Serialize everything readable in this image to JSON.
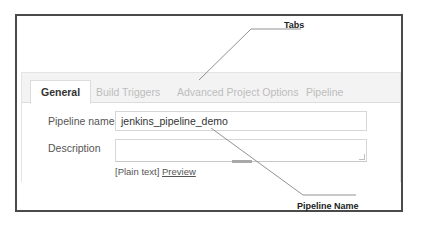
{
  "callouts": {
    "tabs_label": "Tabs",
    "pipeline_name_label": "Pipeline Name"
  },
  "tabs": [
    {
      "label": "General",
      "active": true
    },
    {
      "label": "Build Triggers",
      "active": false
    },
    {
      "label": "Advanced Project Options",
      "active": false
    },
    {
      "label": "Pipeline",
      "active": false
    }
  ],
  "form": {
    "pipeline_name": {
      "label": "Pipeline name",
      "value": "jenkins_pipeline_demo"
    },
    "description": {
      "label": "Description",
      "value": ""
    },
    "help": {
      "plain_text": "[Plain text]",
      "preview_link": "Preview"
    }
  },
  "colors": {
    "frame_border": "#4a4a4a",
    "tabbar_bg": "#f3f3f3",
    "inactive_tab_text": "#bdbdbd",
    "active_tab_text": "#333333",
    "leader_line": "#777777"
  }
}
